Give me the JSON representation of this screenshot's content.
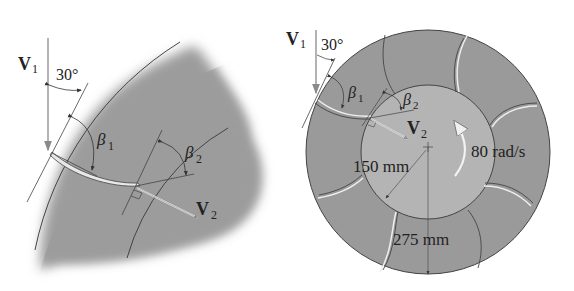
{
  "figure": {
    "left_panel": {
      "name": "blade-detail-view",
      "labels": {
        "v1": "V",
        "v1_sub": "1",
        "angle_30": "30°",
        "beta1": "β",
        "beta1_sub": "1",
        "beta2": "β",
        "beta2_sub": "2",
        "v2": "V",
        "v2_sub": "2"
      }
    },
    "right_panel": {
      "name": "impeller-full-view",
      "labels": {
        "v1": "V",
        "v1_sub": "1",
        "angle_30": "30°",
        "beta1": "β",
        "beta1_sub": "1",
        "beta2": "β",
        "beta2_sub": "2",
        "v2": "V",
        "v2_sub": "2",
        "inner_radius": "150 mm",
        "outer_radius": "275 mm",
        "angular_velocity": "80 rad/s"
      },
      "blade_count": 8
    },
    "colors": {
      "disc_fill": "#9a9a9a",
      "inner_disc_fill": "#b4b4b4",
      "line": "#333333",
      "arrow": "#888888",
      "rotation_arrow": "#f2f2f2"
    }
  }
}
